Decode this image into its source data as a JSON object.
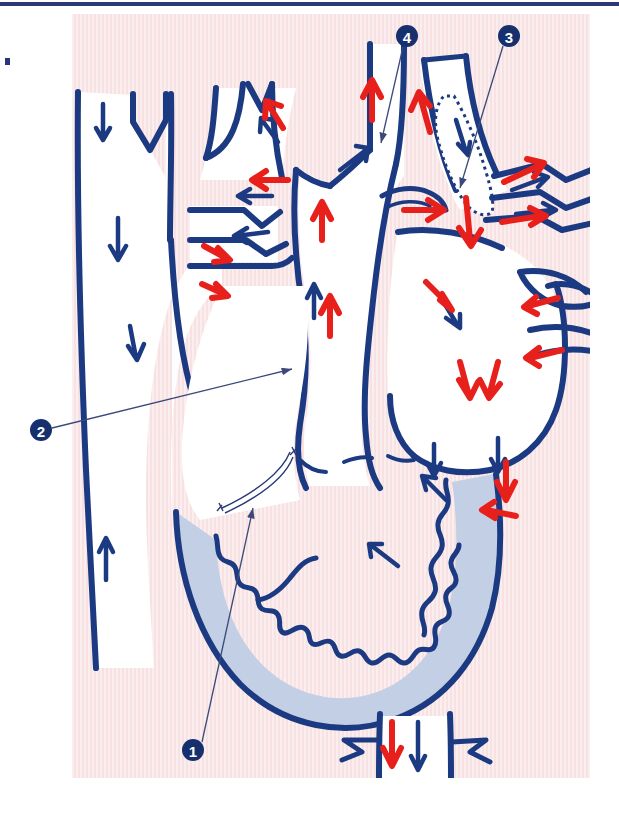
{
  "figure": {
    "type": "anatomical-diagram",
    "panel": {
      "background_color": "#f7dfe0",
      "stripe_color": "#fbeeef",
      "x": 72,
      "y": 14,
      "width": 518,
      "height": 764
    },
    "page": {
      "background_color": "#ffffff",
      "top_rule_color": "#2b3a73",
      "corner_tick_color": "#28357a"
    }
  },
  "colors": {
    "vessel_outline": "#1b3a82",
    "vessel_lumen": "#ffffff",
    "oxygenated_arrow": "#e8201c",
    "deoxygenated_arrow": "#1b3a82",
    "myocardium_fill": "#c3cfe4",
    "marker_circle": "#16306e",
    "marker_number": "#ffffff",
    "leader_line": "#3b4a7a"
  },
  "markers": [
    {
      "id": "marker-1",
      "number": "1",
      "circle": {
        "cx": 193,
        "cy": 750,
        "r": 11
      },
      "leader": {
        "x1": 202,
        "y1": 742,
        "x2": 253,
        "y2": 508
      },
      "points_to": "ductus venosus / inferior vena cava entry",
      "arrowhead": true
    },
    {
      "id": "marker-2",
      "number": "2",
      "circle": {
        "cx": 41,
        "cy": 430,
        "r": 11
      },
      "leader": {
        "x1": 52,
        "y1": 428,
        "x2": 292,
        "y2": 369
      },
      "points_to": "foramen ovale / interatrial septum",
      "arrowhead": true
    },
    {
      "id": "marker-3",
      "number": "3",
      "circle": {
        "cx": 509,
        "cy": 36,
        "r": 11
      },
      "leader": {
        "x1": 503,
        "y1": 46,
        "x2": 460,
        "y2": 188
      },
      "points_to": "ductus arteriosus",
      "arrowhead": true
    },
    {
      "id": "marker-4",
      "number": "4",
      "circle": {
        "cx": 407,
        "cy": 36,
        "r": 11
      },
      "leader": {
        "x1": 403,
        "y1": 47,
        "x2": 381,
        "y2": 143
      },
      "points_to": "aortic arch / aortic isthmus",
      "arrowhead": true
    }
  ],
  "legend_note": {
    "red": "oxygen-rich (oxygenated) blood flow",
    "navy": "oxygen-poor (deoxygenated) blood flow"
  },
  "flow_arrows": {
    "count_red": 19,
    "count_navy": 24,
    "description": "Red arrows mark oxygenated blood entering via the ductus venosus, crossing the foramen ovale to the left atrium and out the ascending aorta; navy arrows mark deoxygenated return through the superior vena cava, right atrium, right ventricle, pulmonary trunk and ductus arteriosus to the descending aorta."
  },
  "structures": [
    {
      "name": "superior-vena-cava",
      "label": "Superior vena cava"
    },
    {
      "name": "brachiocephalic-trunk",
      "label": "Brachiocephalic trunk"
    },
    {
      "name": "left-common-carotid-artery",
      "label": "Left common carotid artery"
    },
    {
      "name": "left-subclavian-artery",
      "label": "Left subclavian artery"
    },
    {
      "name": "aortic-arch",
      "label": "Aortic arch"
    },
    {
      "name": "ductus-arteriosus",
      "label": "Ductus arteriosus"
    },
    {
      "name": "pulmonary-trunk",
      "label": "Pulmonary trunk"
    },
    {
      "name": "pulmonary-veins",
      "label": "Pulmonary veins"
    },
    {
      "name": "right-atrium",
      "label": "Right atrium"
    },
    {
      "name": "left-atrium",
      "label": "Left atrium"
    },
    {
      "name": "left-ventricle",
      "label": "Left ventricle"
    },
    {
      "name": "descending-aorta",
      "label": "Descending aorta"
    },
    {
      "name": "inferior-vena-cava",
      "label": "Inferior vena cava"
    }
  ]
}
